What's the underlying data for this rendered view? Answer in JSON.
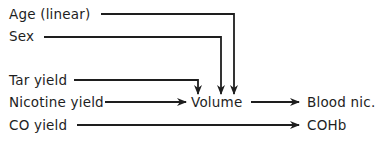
{
  "diagram": {
    "type": "path-diagram",
    "nodes": {
      "age": "Age (linear)",
      "sex": "Sex",
      "tar": "Tar yield",
      "nicotine": "Nicotine yield",
      "co": "CO yield",
      "volume": "Volume",
      "blood_nic": "Blood nic.",
      "cohb": "COHb"
    },
    "edges": [
      {
        "from": "Age (linear)",
        "to": "Volume"
      },
      {
        "from": "Sex",
        "to": "Volume"
      },
      {
        "from": "Tar yield",
        "to": "Volume"
      },
      {
        "from": "Nicotine yield",
        "to": "Volume"
      },
      {
        "from": "Volume",
        "to": "Blood nic."
      },
      {
        "from": "CO yield",
        "to": "COHb"
      }
    ],
    "colors": {
      "line": "#1e1e1e",
      "background": "#ffffff"
    }
  }
}
